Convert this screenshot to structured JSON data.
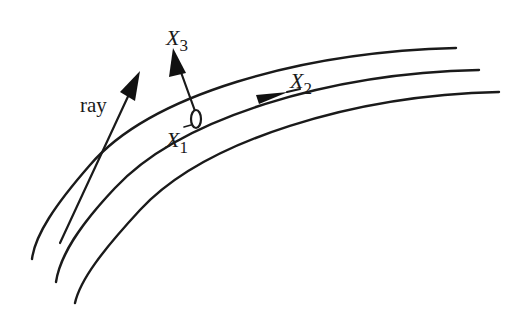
{
  "diagram": {
    "type": "coordinate-frame-on-curved-surfaces",
    "colors": {
      "stroke": "#1a1a1a",
      "background": "#ffffff"
    },
    "curves": [
      {
        "id": "outer-surface",
        "d": "M 456 48 C 300 52, 150 95, 90 165 C 55 205, 35 235, 32 259"
      },
      {
        "id": "middle-surface",
        "d": "M 479 70 C 330 73, 180 118, 115 188 C 80 225, 60 255, 56 282"
      },
      {
        "id": "inner-surface",
        "d": "M 499 92 C 355 95, 205 140, 140 210 C 103 250, 80 280, 75 303"
      }
    ],
    "arrows": [
      {
        "id": "ray-arrow",
        "from": [
          60,
          243
        ],
        "to": [
          140,
          71
        ]
      },
      {
        "id": "x3-arrow",
        "from": [
          195,
          112
        ],
        "to": [
          173,
          48
        ]
      },
      {
        "id": "x2-arrow",
        "from": [
          256,
          100
        ],
        "to": [
          288,
          92
        ]
      }
    ],
    "origin_marker": {
      "cx": 196,
      "cy": 119,
      "rx": 5,
      "ry": 9
    },
    "labels": {
      "ray": {
        "text": "ray",
        "x": 80,
        "y": 112
      },
      "x3": {
        "main": "X",
        "sub": "3",
        "x": 166,
        "y": 45
      },
      "x2": {
        "main": "X",
        "sub": "2",
        "x": 290,
        "y": 88
      },
      "x1": {
        "main": "X",
        "sub": "1",
        "x": 166,
        "y": 147
      }
    }
  }
}
